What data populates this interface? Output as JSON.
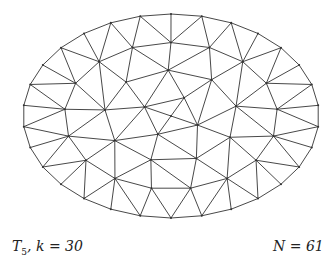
{
  "figure": {
    "type": "triangular-mesh",
    "shape": "ellipse",
    "label_left": {
      "symbol": "T",
      "subscript": "5",
      "rest": ", k = 30"
    },
    "label_right": "N = 61",
    "vertex_count": 61,
    "boundary_points": 30,
    "stroke_color": "#333333",
    "background": "#ffffff"
  }
}
